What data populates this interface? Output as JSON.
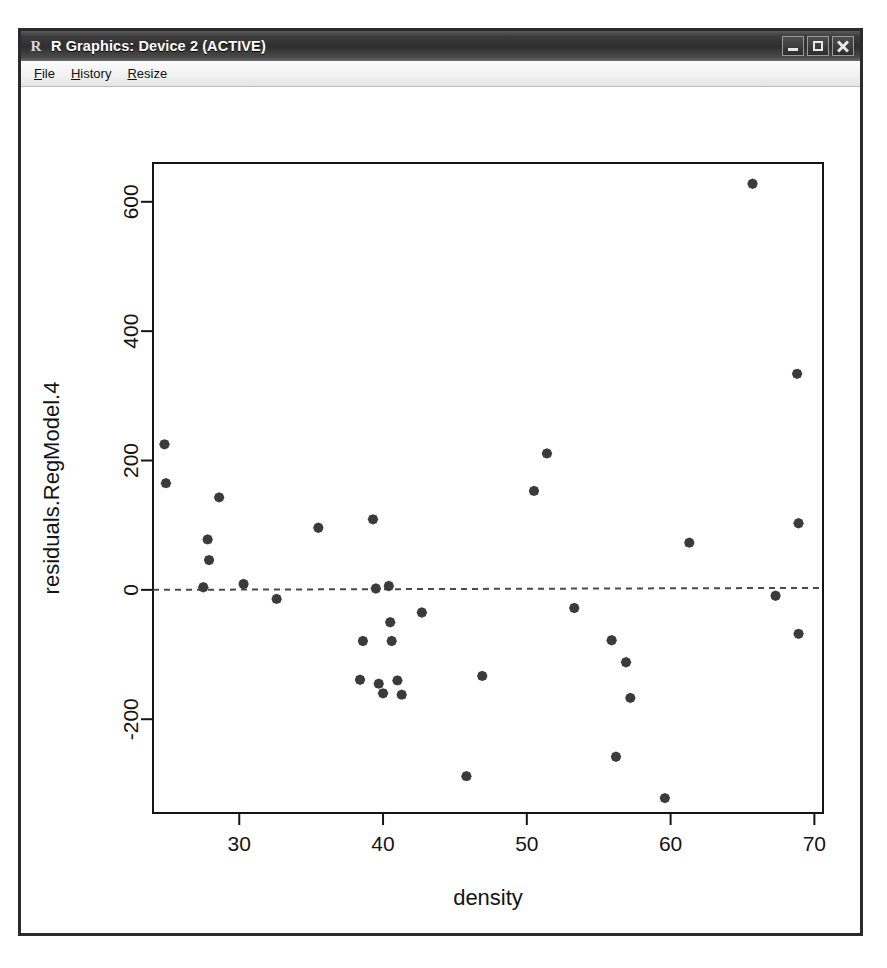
{
  "window": {
    "title": "R Graphics: Device 2 (ACTIVE)",
    "logo_glyph": "R",
    "controls": [
      {
        "name": "minimize",
        "label": "Minimize"
      },
      {
        "name": "maximize",
        "label": "Maximize"
      },
      {
        "name": "close",
        "label": "Close"
      }
    ]
  },
  "menubar": {
    "items": [
      {
        "label": "File",
        "accesskey": "F"
      },
      {
        "label": "History",
        "accesskey": "H"
      },
      {
        "label": "Resize",
        "accesskey": "R"
      }
    ]
  },
  "chart_data": {
    "type": "scatter",
    "title": "",
    "xlabel": "density",
    "ylabel": "residuals.RegModel.4",
    "xlim": [
      24.0,
      70.6
    ],
    "ylim": [
      -345,
      660
    ],
    "xticks": [
      30,
      40,
      50,
      60,
      70
    ],
    "yticks": [
      -200,
      0,
      200,
      400,
      600
    ],
    "grid": false,
    "legend": null,
    "point_color": "#3b3b3b",
    "point_symbol": "filled-diamond",
    "reference_line": {
      "type": "horizontal-dashed",
      "y": 0,
      "color": "#4a4a4a",
      "dash": "6,5"
    },
    "x": [
      24.8,
      24.9,
      27.5,
      27.8,
      27.9,
      28.6,
      30.3,
      32.6,
      35.5,
      38.4,
      38.6,
      39.3,
      39.5,
      39.7,
      40.0,
      40.4,
      40.5,
      40.6,
      41.0,
      41.3,
      42.7,
      45.8,
      46.9,
      50.5,
      51.4,
      53.3,
      55.9,
      56.2,
      56.9,
      57.2,
      59.6,
      61.3,
      65.7,
      67.3,
      68.8,
      68.9,
      68.9
    ],
    "y": [
      225,
      165,
      4,
      78,
      46,
      143,
      9,
      -14,
      96,
      -139,
      -79,
      109,
      2,
      -145,
      -160,
      6,
      -50,
      -79,
      -140,
      -162,
      -35,
      -288,
      -133,
      153,
      211,
      -28,
      -78,
      -258,
      -112,
      -167,
      -322,
      73,
      628,
      -9,
      334,
      103,
      -68
    ],
    "n_points": 37
  }
}
